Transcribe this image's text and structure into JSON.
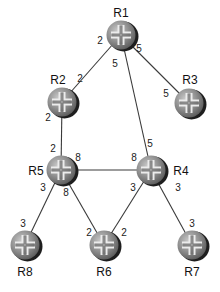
{
  "diagram": {
    "type": "network-topology",
    "routers": [
      {
        "id": "R1",
        "label": "R1",
        "x": 121,
        "y": 35,
        "label_x": 121,
        "label_y": 17,
        "anchor": "middle"
      },
      {
        "id": "R2",
        "label": "R2",
        "x": 62,
        "y": 102,
        "label_x": 58,
        "label_y": 84,
        "anchor": "middle"
      },
      {
        "id": "R3",
        "label": "R3",
        "x": 189,
        "y": 103,
        "label_x": 190,
        "label_y": 84,
        "anchor": "middle"
      },
      {
        "id": "R5",
        "label": "R5",
        "x": 61,
        "y": 170,
        "label_x": 36,
        "label_y": 175,
        "anchor": "middle"
      },
      {
        "id": "R4",
        "label": "R4",
        "x": 151,
        "y": 170,
        "label_x": 181,
        "label_y": 175,
        "anchor": "middle"
      },
      {
        "id": "R8",
        "label": "R8",
        "x": 25,
        "y": 245,
        "label_x": 25,
        "label_y": 276,
        "anchor": "middle"
      },
      {
        "id": "R6",
        "label": "R6",
        "x": 104,
        "y": 245,
        "label_x": 104,
        "label_y": 276,
        "anchor": "middle"
      },
      {
        "id": "R7",
        "label": "R7",
        "x": 192,
        "y": 245,
        "label_x": 192,
        "label_y": 276,
        "anchor": "middle"
      }
    ],
    "links": [
      {
        "from": "R1",
        "to": "R2",
        "cost_from": "2",
        "cost_to": "2",
        "cf_x": 100,
        "cf_y": 44,
        "ct_x": 80,
        "ct_y": 82
      },
      {
        "from": "R1",
        "to": "R3",
        "cost_from": "5",
        "cost_to": "5",
        "cf_x": 139,
        "cf_y": 52,
        "ct_x": 166,
        "ct_y": 97
      },
      {
        "from": "R1",
        "to": "R4",
        "cost_from": "5",
        "cost_to": "5",
        "cf_x": 115,
        "cf_y": 67,
        "ct_x": 150,
        "ct_y": 147
      },
      {
        "from": "R2",
        "to": "R5",
        "cost_from": "2",
        "cost_to": "2",
        "cf_x": 48,
        "cf_y": 121,
        "ct_x": 53,
        "ct_y": 152
      },
      {
        "from": "R5",
        "to": "R4",
        "cost_from": "8",
        "cost_to": "8",
        "cf_x": 78,
        "cf_y": 161,
        "ct_x": 134,
        "ct_y": 161
      },
      {
        "from": "R5",
        "to": "R8",
        "cost_from": "3",
        "cost_to": "3",
        "cf_x": 43,
        "cf_y": 191,
        "ct_x": 23,
        "ct_y": 227
      },
      {
        "from": "R5",
        "to": "R6",
        "cost_from": "8",
        "cost_to": "2",
        "cf_x": 66,
        "cf_y": 196,
        "ct_x": 89,
        "ct_y": 236
      },
      {
        "from": "R4",
        "to": "R6",
        "cost_from": "3",
        "cost_to": "2",
        "cf_x": 133,
        "cf_y": 191,
        "ct_x": 124,
        "ct_y": 236
      },
      {
        "from": "R4",
        "to": "R7",
        "cost_from": "3",
        "cost_to": "3",
        "cf_x": 178,
        "cf_y": 191,
        "ct_x": 192,
        "ct_y": 227
      }
    ]
  },
  "labels": {
    "R1": "R1",
    "R2": "R2",
    "R3": "R3",
    "R4": "R4",
    "R5": "R5",
    "R6": "R6",
    "R7": "R7",
    "R8": "R8"
  },
  "colors": {
    "link": "#3a3a3a",
    "router_body": "#8f8f8f",
    "router_shadow": "#1e1e1e",
    "router_cross": "#e6e6e6",
    "background": "#ffffff"
  }
}
